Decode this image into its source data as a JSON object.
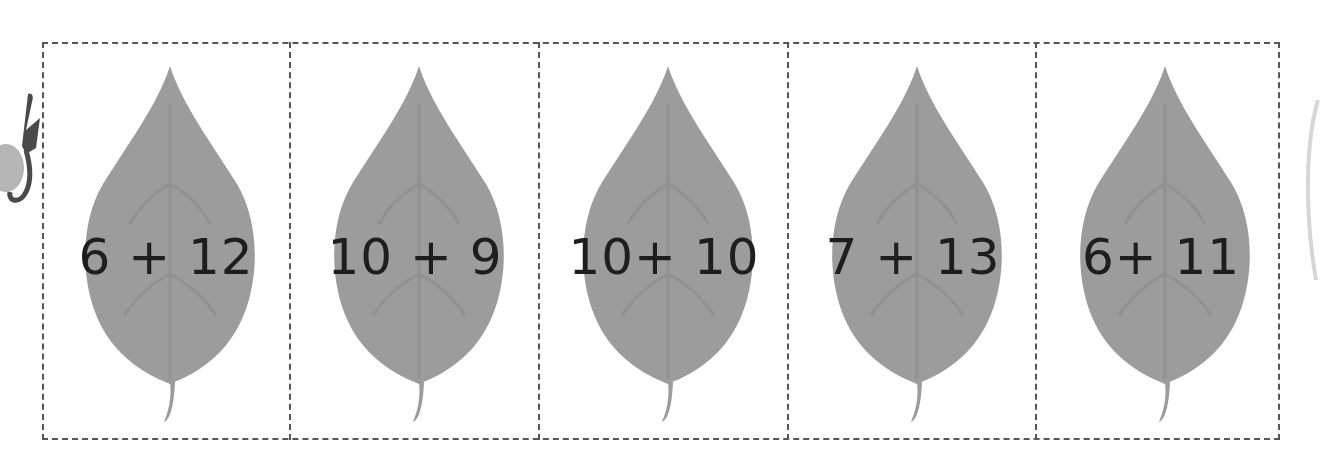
{
  "worksheet": {
    "instruction_icon": "scissors-icon",
    "cards": [
      {
        "expression": "6 + 12"
      },
      {
        "expression": "10 + 9"
      },
      {
        "expression": "10+ 10"
      },
      {
        "expression": "7 + 13"
      },
      {
        "expression": "6+ 11"
      }
    ]
  },
  "colors": {
    "leaf": "#9c9c9c",
    "leaf_vein": "#8a8a8a",
    "dash": "#555555",
    "text": "#1e1e1e"
  }
}
